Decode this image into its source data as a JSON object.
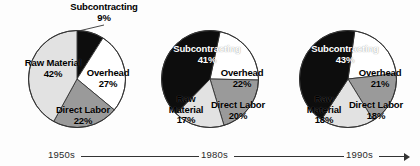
{
  "chart_data": {
    "type": "pie",
    "title": "",
    "subtitle": "",
    "legend_position": "in-slice-labels",
    "grid": false,
    "categories": [
      "Subcontracting",
      "Overhead",
      "Direct Labor",
      "Raw Material"
    ],
    "colors": {
      "Subcontracting": "#0d0d0d",
      "Overhead": "#ffffff",
      "Direct Labor": "#9a9a9a",
      "Raw Material": "#e2e2e2",
      "outline": "#333333",
      "background": "#fdfdfd",
      "timeline": "#333333"
    },
    "charts": [
      {
        "era": "1950s",
        "slices": [
          {
            "name": "Subcontracting",
            "value": 9,
            "label": "9%",
            "fill": "#0d0d0d",
            "dark": true
          },
          {
            "name": "Overhead",
            "value": 27,
            "label": "27%",
            "fill": "#ffffff",
            "dark": false
          },
          {
            "name": "Direct Labor",
            "value": 22,
            "label": "22%",
            "fill": "#9a9a9a",
            "dark": false
          },
          {
            "name": "Raw Material",
            "value": 42,
            "label": "42%",
            "fill": "#e2e2e2",
            "dark": false
          }
        ]
      },
      {
        "era": "1980s",
        "slices": [
          {
            "name": "Subcontracting",
            "value": 41,
            "label": "41%",
            "fill": "#0d0d0d",
            "dark": true
          },
          {
            "name": "Overhead",
            "value": 22,
            "label": "22%",
            "fill": "#ffffff",
            "dark": false
          },
          {
            "name": "Direct Labor",
            "value": 20,
            "label": "20%",
            "fill": "#9a9a9a",
            "dark": false
          },
          {
            "name": "Raw Material",
            "value": 17,
            "label": "17%",
            "fill": "#e2e2e2",
            "dark": false
          }
        ]
      },
      {
        "era": "1990s",
        "slices": [
          {
            "name": "Subcontracting",
            "value": 43,
            "label": "43%",
            "fill": "#0d0d0d",
            "dark": true
          },
          {
            "name": "Overhead",
            "value": 21,
            "label": "21%",
            "fill": "#ffffff",
            "dark": false
          },
          {
            "name": "Direct Labor",
            "value": 18,
            "label": "18%",
            "fill": "#9a9a9a",
            "dark": false
          },
          {
            "name": "Raw Material",
            "value": 18,
            "label": "18%",
            "fill": "#e2e2e2",
            "dark": false
          }
        ]
      }
    ]
  },
  "pies": [
    {
      "era": "1950s",
      "labels": {
        "subcontracting": {
          "name": "Subcontracting",
          "pct": "9%"
        },
        "overhead": {
          "name": "Overhead",
          "pct": "27%"
        },
        "direct_labor": {
          "name": "Direct Labor",
          "pct": "22%"
        },
        "raw_material": {
          "name": "Raw Material",
          "pct": "42%"
        }
      }
    },
    {
      "era": "1980s",
      "labels": {
        "subcontracting": {
          "name": "Subcontracting",
          "pct": "41%"
        },
        "overhead": {
          "name": "Overhead",
          "pct": "22%"
        },
        "direct_labor": {
          "name": "Direct Labor",
          "pct": "20%"
        },
        "raw_material": {
          "name_line1": "Raw",
          "name_line2": "Material",
          "pct": "17%"
        }
      }
    },
    {
      "era": "1990s",
      "labels": {
        "subcontracting": {
          "name": "Subcontracting",
          "pct": "43%"
        },
        "overhead": {
          "name": "Overhead",
          "pct": "21%"
        },
        "direct_labor": {
          "name": "Direct Labor",
          "pct": "18%"
        },
        "raw_material": {
          "name_line1": "Raw",
          "name_line2": "Material",
          "pct": "18%"
        }
      }
    }
  ],
  "timeline": {
    "eras": [
      "1950s",
      "1980s",
      "1990s"
    ],
    "era_1": "1950s",
    "era_2": "1980s",
    "era_3": "1990s"
  }
}
